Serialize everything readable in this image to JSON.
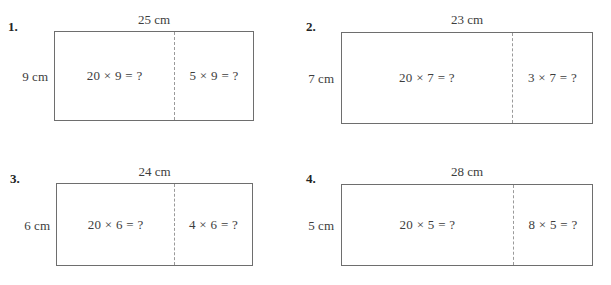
{
  "page": {
    "problem_count": 4
  },
  "problems": [
    {
      "number": "1.",
      "top_label": "25 cm",
      "side_label": "9 cm",
      "left_expression": "20 × 9 = ?",
      "right_expression": "5 × 9 = ?"
    },
    {
      "number": "2.",
      "top_label": "23 cm",
      "side_label": "7 cm",
      "left_expression": "20 × 7 = ?",
      "right_expression": "3 × 7 = ?"
    },
    {
      "number": "3.",
      "top_label": "24 cm",
      "side_label": "6 cm",
      "left_expression": "20 × 6 = ?",
      "right_expression": "4 × 6 = ?"
    },
    {
      "number": "4.",
      "top_label": "28 cm",
      "side_label": "5 cm",
      "left_expression": "20 × 5 = ?",
      "right_expression": "8 × 5 = ?"
    }
  ],
  "colors": {
    "rect_border": "#6e6e6e",
    "divider": "#9a9a9a",
    "text": "#3d3d3d",
    "number_text": "#242424",
    "background": "#ffffff"
  }
}
